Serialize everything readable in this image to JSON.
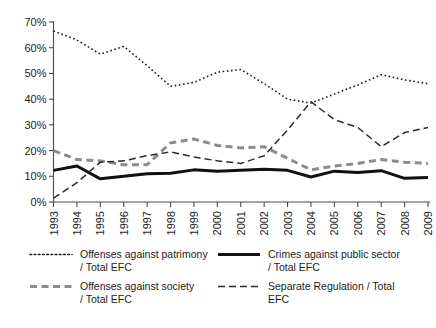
{
  "chart_data": {
    "type": "line",
    "title": "",
    "subtitle": "",
    "xlabel": "",
    "ylabel": "",
    "x": [
      1993,
      1994,
      1995,
      1996,
      1997,
      1998,
      1999,
      2000,
      2001,
      2002,
      2003,
      2004,
      2005,
      2006,
      2007,
      2008,
      2009
    ],
    "categories": [
      "1993",
      "1994",
      "1995",
      "1996",
      "1997",
      "1998",
      "1999",
      "2000",
      "2001",
      "2002",
      "2003",
      "2004",
      "2005",
      "2006",
      "2007",
      "2008",
      "2009"
    ],
    "xlim": [
      1993,
      2009
    ],
    "ylim": [
      0,
      70
    ],
    "yticks": [
      0,
      10,
      20,
      30,
      40,
      50,
      60,
      70
    ],
    "ytick_labels": [
      "0%",
      "10%",
      "20%",
      "30%",
      "40%",
      "50%",
      "60%",
      "70%"
    ],
    "grid": false,
    "legend_position": "bottom",
    "series": [
      {
        "name": "Offenses against patrimony / Total EFC",
        "style": "dotted",
        "color": "#1c1c1c",
        "width": 1.6,
        "values": [
          66.5,
          63.0,
          57.5,
          60.5,
          53.0,
          45.0,
          46.5,
          50.5,
          51.5,
          46.0,
          40.0,
          38.5,
          42.0,
          45.5,
          49.5,
          47.5,
          46.0
        ]
      },
      {
        "name": "Crimes against public sector / Total EFC",
        "style": "solid",
        "color": "#111111",
        "width": 3.0,
        "values": [
          12.3,
          14.0,
          9.0,
          10.0,
          11.0,
          11.2,
          12.5,
          12.0,
          12.3,
          12.7,
          12.3,
          9.7,
          12.0,
          11.5,
          12.2,
          9.2,
          9.5
        ]
      },
      {
        "name": "Offenses against society / Total EFC",
        "style": "dashed-thick",
        "color": "#8c8c8c",
        "width": 3.0,
        "values": [
          20.0,
          16.5,
          16.0,
          14.5,
          14.5,
          23.0,
          24.5,
          22.0,
          21.0,
          21.5,
          17.0,
          12.5,
          14.0,
          15.0,
          16.5,
          15.5,
          15.0
        ]
      },
      {
        "name": "Separate Regulation / Total EFC",
        "style": "dashed-thin",
        "color": "#2a2a2a",
        "width": 1.5,
        "values": [
          1.5,
          7.5,
          15.5,
          16.0,
          18.0,
          19.5,
          17.5,
          16.0,
          15.0,
          18.0,
          28.0,
          39.0,
          32.0,
          29.0,
          21.5,
          27.0,
          29.0
        ]
      }
    ]
  },
  "axes": {
    "y_tick_labels": [
      "70%",
      "60%",
      "50%",
      "40%",
      "30%",
      "20%",
      "10%",
      "0%"
    ],
    "x_tick_labels": [
      "1993",
      "1994",
      "1995",
      "1996",
      "1997",
      "1998",
      "1999",
      "2000",
      "2001",
      "2002",
      "2003",
      "2004",
      "2005",
      "2006",
      "2007",
      "2008",
      "2009"
    ]
  },
  "legend": {
    "entries": [
      {
        "label_line1": "Offenses against patrimony",
        "label_line2": "/ Total EFC",
        "style": "dotted"
      },
      {
        "label_line1": "Crimes against public sector",
        "label_line2": "/ Total EFC",
        "style": "solid"
      },
      {
        "label_line1": "Offenses against society",
        "label_line2": "/ Total EFC",
        "style": "dashed-thick"
      },
      {
        "label_line1": "Separate Regulation / Total",
        "label_line2": "EFC",
        "style": "dashed-thin"
      }
    ]
  }
}
